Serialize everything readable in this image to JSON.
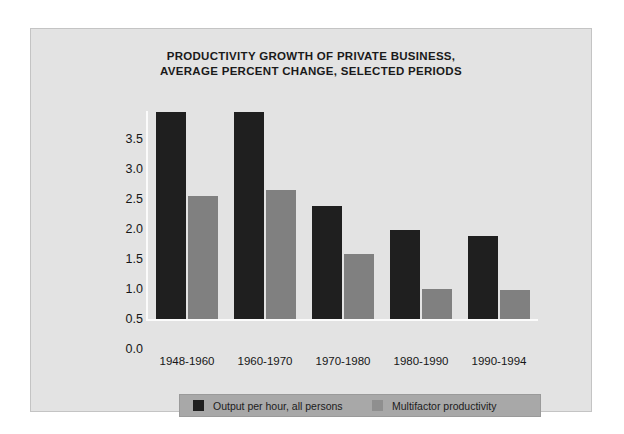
{
  "chart_data": {
    "type": "bar",
    "title": "PRODUCTIVITY GROWTH OF PRIVATE BUSINESS, AVERAGE PERCENT CHANGE, SELECTED PERIODS",
    "title_lines": [
      "PRODUCTIVITY GROWTH OF PRIVATE BUSINESS,",
      "AVERAGE PERCENT CHANGE, SELECTED PERIODS"
    ],
    "xlabel": "",
    "ylabel": "",
    "categories": [
      "1948-1960",
      "1960-1970",
      "1970-1980",
      "1980-1990",
      "1990-1994"
    ],
    "series": [
      {
        "name": "Output per hour, all persons",
        "color": "#1f1f1f",
        "values": [
          3.45,
          3.45,
          1.88,
          1.48,
          1.38
        ]
      },
      {
        "name": "Multifactor productivity",
        "color": "#808080",
        "values": [
          2.05,
          2.15,
          1.08,
          0.5,
          0.48
        ]
      }
    ],
    "ylim": [
      0.0,
      3.5
    ],
    "ytick_labels": [
      "3.5",
      "3.0",
      "2.5",
      "2.0",
      "1.5",
      "1.0",
      "0.5",
      "0.0"
    ],
    "ytick_values": [
      3.5,
      3.0,
      2.5,
      2.0,
      1.5,
      1.0,
      0.5,
      0.0
    ],
    "grid": false,
    "legend_position": "bottom",
    "panel_color": "#e3e3e3",
    "legend_background": "#a8a8a8"
  }
}
